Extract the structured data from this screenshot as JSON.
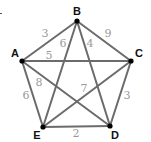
{
  "diagram": {
    "type": "weighted complete graph",
    "colors": {
      "edge": "#6b6b6b",
      "node": "#000000",
      "node_label": "#111111",
      "weight_label": "#9a9a9a"
    },
    "nodes": [
      {
        "id": "A",
        "label": "A",
        "x": 22,
        "y": 61,
        "lx": 15,
        "ly": 57
      },
      {
        "id": "B",
        "label": "B",
        "x": 77,
        "y": 21,
        "lx": 77,
        "ly": 15
      },
      {
        "id": "C",
        "label": "C",
        "x": 131,
        "y": 61,
        "lx": 139,
        "ly": 57
      },
      {
        "id": "D",
        "label": "D",
        "x": 110,
        "y": 126,
        "lx": 115,
        "ly": 139
      },
      {
        "id": "E",
        "label": "E",
        "x": 43,
        "y": 127,
        "lx": 37,
        "ly": 139
      }
    ],
    "edges": [
      {
        "from": "A",
        "to": "B",
        "weight": "3",
        "wx": 45,
        "wy": 37
      },
      {
        "from": "B",
        "to": "C",
        "weight": "9",
        "wx": 108,
        "wy": 37
      },
      {
        "from": "A",
        "to": "C",
        "weight": "5",
        "wx": 49,
        "wy": 59
      },
      {
        "from": "B",
        "to": "E",
        "weight": "6",
        "wx": 63,
        "wy": 47
      },
      {
        "from": "B",
        "to": "D",
        "weight": "4",
        "wx": 90,
        "wy": 47
      },
      {
        "from": "A",
        "to": "D",
        "weight": "8",
        "wx": 39,
        "wy": 86
      },
      {
        "from": "C",
        "to": "E",
        "weight": "7",
        "wx": 84,
        "wy": 92
      },
      {
        "from": "A",
        "to": "E",
        "weight": "6",
        "wx": 26,
        "wy": 99
      },
      {
        "from": "C",
        "to": "D",
        "weight": "3",
        "wx": 127,
        "wy": 99
      },
      {
        "from": "E",
        "to": "D",
        "weight": "2",
        "wx": 76,
        "wy": 137
      }
    ]
  }
}
